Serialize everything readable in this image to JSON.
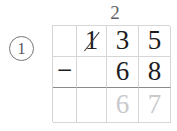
{
  "problem": {
    "number_label": "1",
    "number_style": "circled",
    "operation": "subtraction",
    "operator_label": "−",
    "regroup_mark": "2",
    "minuend_digits": [
      "",
      "1",
      "3",
      "5"
    ],
    "minuend_struck_index": 1,
    "subtrahend_digits": [
      "",
      "",
      "6",
      "8"
    ],
    "answer_digits": [
      "",
      "",
      "6",
      "7"
    ],
    "answer_is_faded": true,
    "columns": 4,
    "rows": 3
  },
  "colors": {
    "grid_line": "#d6d6d8",
    "answer_rule": "#8a8a8e",
    "ink": "#1d1d1f",
    "faded_ink": "#c9c9cc",
    "annotation": "#5f5f63",
    "background": "#ffffff"
  }
}
